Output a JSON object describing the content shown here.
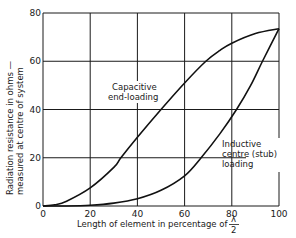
{
  "chart_data": {
    "type": "line",
    "title": "",
    "xlabel": "Length of element in percentage of λ/2",
    "xlabel_main": "Length of element in percentage of",
    "xlabel_frac_num": "λ",
    "xlabel_frac_den": "2",
    "ylabel_line1": "Radiation resistance in ohms —",
    "ylabel_line2": "measured at centre of system",
    "xlim": [
      0,
      100
    ],
    "ylim": [
      0,
      80
    ],
    "xticks": [
      "0",
      "20",
      "40",
      "60",
      "80",
      "100"
    ],
    "yticks": [
      "0",
      "20",
      "40",
      "60",
      "80"
    ],
    "grid": true,
    "series": [
      {
        "name": "Capacitive end-loading",
        "label_line1": "Capacitive",
        "label_line2": "end-loading",
        "x": [
          0,
          5,
          10,
          20,
          30,
          33,
          40,
          50,
          60,
          69,
          75,
          80,
          90,
          100
        ],
        "y": [
          0,
          0.5,
          2,
          7.5,
          16,
          20,
          28.5,
          40,
          51,
          60,
          64.5,
          67.5,
          71.5,
          73.5
        ]
      },
      {
        "name": "Inductive centre (stub) loading",
        "label_line1": "Inductive",
        "label_line2": "centre (stub)",
        "label_line3": "loading",
        "x": [
          0,
          10,
          20,
          30,
          40,
          50,
          60,
          67,
          75,
          82,
          88,
          93,
          100
        ],
        "y": [
          0,
          0,
          0.3,
          1.2,
          3,
          6.5,
          12.5,
          20,
          30,
          40,
          50,
          60,
          73.5
        ]
      }
    ]
  }
}
